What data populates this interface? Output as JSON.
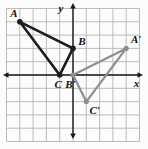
{
  "figure": {
    "background_color": "#fcfcfc",
    "grid": {
      "color": "#b4b4b4",
      "unit_px": 13.3,
      "origin_px": {
        "x": 73,
        "y": 75
      },
      "x_min": -5,
      "x_max": 5,
      "y_min": -5,
      "y_max": 5
    },
    "axes": {
      "color": "#1a1a1a",
      "x_label": "x",
      "y_label": "y",
      "x_label_px": {
        "x": 136.5,
        "y": 83.5
      },
      "y_label_px": {
        "x": 61,
        "y": 8
      },
      "x_span_px": [
        3,
        143
      ],
      "y_span_px": [
        3,
        139
      ]
    },
    "label_color": "#111111",
    "triangles": [
      {
        "name": "triangle-ABC",
        "color": "#1c1c1c",
        "stroke_width": 2.6,
        "dot_radius": 2.8,
        "vertices": [
          {
            "label": "A",
            "x": -4,
            "y": 4,
            "label_dx": -6,
            "label_dy": -9
          },
          {
            "label": "B",
            "x": 0,
            "y": 2,
            "label_dx": 9,
            "label_dy": -7.5
          },
          {
            "label": "C",
            "x": -1,
            "y": 0,
            "label_dx": -1.5,
            "label_dy": 9
          }
        ]
      },
      {
        "name": "triangle-A-prime-B-prime-C-prime",
        "color": "#8f8f8f",
        "stroke_width": 2.2,
        "dot_radius": 2.6,
        "vertices": [
          {
            "label": "A′",
            "x": 4,
            "y": 2,
            "label_dx": 10,
            "label_dy": -9
          },
          {
            "label": "B′",
            "x": 0,
            "y": 0,
            "label_dx": -2.5,
            "label_dy": 9
          },
          {
            "label": "C′",
            "x": 1,
            "y": -2,
            "label_dx": 8.5,
            "label_dy": 8.5
          }
        ]
      }
    ]
  }
}
